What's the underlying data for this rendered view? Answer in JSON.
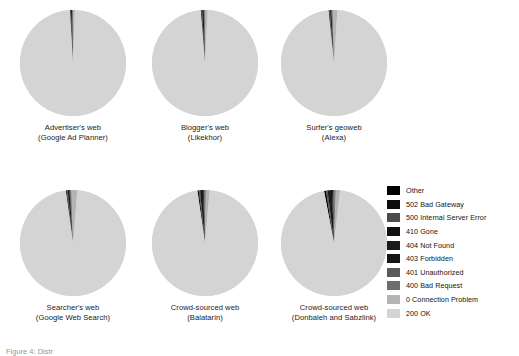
{
  "figure": {
    "caption_truncated": "Figure 4: Distr",
    "background": "#ffffff"
  },
  "legend": {
    "position": "right",
    "items": [
      {
        "label": "Other",
        "color": "#000000"
      },
      {
        "label": "502 Bad Gateway",
        "color": "#0d0d0d"
      },
      {
        "label": "500 Internal Server Error",
        "color": "#4d4d4d"
      },
      {
        "label": "410 Gone",
        "color": "#111111"
      },
      {
        "label": "404 Not Found",
        "color": "#1a1a1a"
      },
      {
        "label": "403 Forbidden",
        "color": "#151515"
      },
      {
        "label": "401 Unauthorized",
        "color": "#5a5a5a"
      },
      {
        "label": "400 Bad Request",
        "color": "#6e6e6e"
      },
      {
        "label": "0 Connection Problem",
        "color": "#b4b4b4"
      },
      {
        "label": "200 OK",
        "color": "#d4d4d4"
      }
    ]
  },
  "chart_data": {
    "type": "pie",
    "title": "",
    "legend_position": "right",
    "categories": [
      "Other",
      "502 Bad Gateway",
      "500 Internal Server Error",
      "410 Gone",
      "404 Not Found",
      "403 Forbidden",
      "401 Unauthorized",
      "400 Bad Request",
      "0 Connection Problem",
      "200 OK"
    ],
    "category_colors": [
      "#000000",
      "#0d0d0d",
      "#4d4d4d",
      "#111111",
      "#1a1a1a",
      "#151515",
      "#5a5a5a",
      "#6e6e6e",
      "#b4b4b4",
      "#d4d4d4"
    ],
    "charts": [
      {
        "id": "advertisers-web",
        "label_line1": "Advertiser's web",
        "label_line2": "(Google Ad Planner)",
        "values": [
          0.15,
          0.05,
          0.1,
          0.05,
          0.3,
          0.1,
          0.1,
          0.15,
          0.55,
          98.45
        ]
      },
      {
        "id": "bloggers-web",
        "label_line1": "Blogger's web",
        "label_line2": "(Likekhor)",
        "values": [
          0.2,
          0.05,
          0.15,
          0.05,
          0.45,
          0.15,
          0.15,
          0.2,
          0.7,
          97.9
        ]
      },
      {
        "id": "surfers-geoweb",
        "label_line1": "Surfer's geoweb",
        "label_line2": "(Alexa)",
        "values": [
          0.2,
          0.05,
          0.15,
          0.05,
          0.4,
          0.1,
          0.15,
          0.2,
          1.4,
          97.3
        ]
      },
      {
        "id": "searchers-web",
        "label_line1": "Searcher's web",
        "label_line2": "(Google Web Search)",
        "values": [
          0.25,
          0.05,
          0.2,
          0.05,
          0.55,
          0.15,
          0.2,
          0.25,
          1.8,
          96.5
        ]
      },
      {
        "id": "crowd-sourced-balatarin",
        "label_line1": "Crowd-sourced web",
        "label_line2": "(Balatarin)",
        "values": [
          0.4,
          0.1,
          0.25,
          0.05,
          0.9,
          0.25,
          0.25,
          0.35,
          1.15,
          96.3
        ]
      },
      {
        "id": "crowd-sourced-donbaleh-sabzlink",
        "label_line1": "Crowd-sourced web",
        "label_line2": "(Donbaleh and Sabzlink)",
        "values": [
          0.55,
          0.1,
          0.35,
          0.1,
          1.3,
          0.35,
          0.35,
          0.45,
          1.3,
          95.15
        ]
      }
    ]
  }
}
